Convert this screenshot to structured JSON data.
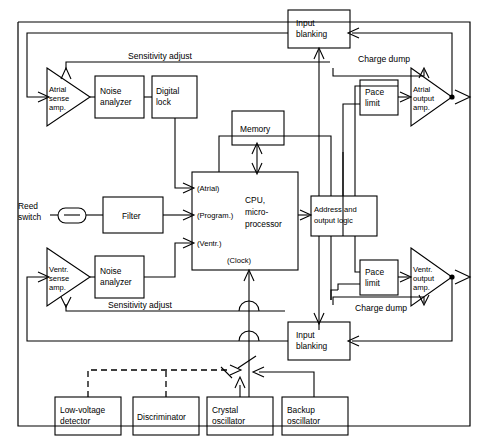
{
  "figure": {
    "type": "block-diagram",
    "line_color": "#000000",
    "background_color": "#ffffff",
    "border": {
      "present": true,
      "style": "solid"
    }
  },
  "blocks": {
    "input_blanking_top": {
      "label_line1": "Input",
      "label_line2": "blanking",
      "shape": "rect"
    },
    "input_blanking_bottom": {
      "label_line1": "Input",
      "label_line2": "blanking",
      "shape": "rect"
    },
    "noise_analyzer_atrial": {
      "label_line1": "Noise",
      "label_line2": "analyzer",
      "shape": "rect"
    },
    "noise_analyzer_ventr": {
      "label_line1": "Noise",
      "label_line2": "analyzer",
      "shape": "rect"
    },
    "digital_lock": {
      "label_line1": "Digital",
      "label_line2": "lock",
      "shape": "rect"
    },
    "memory": {
      "label_line1": "Memory",
      "shape": "rect"
    },
    "filter": {
      "label_line1": "Filter",
      "shape": "rect"
    },
    "cpu": {
      "label_line1": "CPU,",
      "label_line2": "micro-",
      "label_line3": "processor",
      "shape": "rect",
      "port_atrial": "(Atrial)",
      "port_program": "(Program.)",
      "port_ventr": "(Ventr.)",
      "port_clock": "(Clock)"
    },
    "address_output_logic": {
      "label_line1": "Address and",
      "label_line2": "output logic",
      "shape": "rect"
    },
    "pace_limit_atrial": {
      "label_line1": "Pace",
      "label_line2": "limit",
      "shape": "rect"
    },
    "pace_limit_ventr": {
      "label_line1": "Pace",
      "label_line2": "limit",
      "shape": "rect"
    },
    "low_voltage_detector": {
      "label_line1": "Low-voltage",
      "label_line2": "detector",
      "shape": "rect"
    },
    "discriminator": {
      "label_line1": "Discriminator",
      "shape": "rect"
    },
    "crystal_oscillator": {
      "label_line1": "Crystal",
      "label_line2": "oscillator",
      "shape": "rect"
    },
    "backup_oscillator": {
      "label_line1": "Backup",
      "label_line2": "oscillator",
      "shape": "rect"
    }
  },
  "amplifiers": {
    "atrial_sense_amp": {
      "label_line1": "Atrial",
      "label_line2": "sense",
      "label_line3": "amp.",
      "shape": "triangle",
      "direction": "right"
    },
    "ventr_sense_amp": {
      "label_line1": "Ventr.",
      "label_line2": "sense",
      "label_line3": "amp.",
      "shape": "triangle",
      "direction": "right"
    },
    "atrial_output_amp": {
      "label_line1": "Atrial",
      "label_line2": "output",
      "label_line3": "amp.",
      "shape": "triangle",
      "direction": "right"
    },
    "ventr_output_amp": {
      "label_line1": "Ventr.",
      "label_line2": "output",
      "label_line3": "amp.",
      "shape": "triangle",
      "direction": "right"
    }
  },
  "free_labels": {
    "sensitivity_adjust_atrial": "Sensitivity adjust",
    "sensitivity_adjust_ventr": "Sensitivity adjust",
    "charge_dump_atrial": "Charge dump",
    "charge_dump_ventr": "Charge dump",
    "reed_switch": {
      "line1": "Reed",
      "line2": "switch",
      "symbol": "reed-switch-ellipse"
    }
  }
}
